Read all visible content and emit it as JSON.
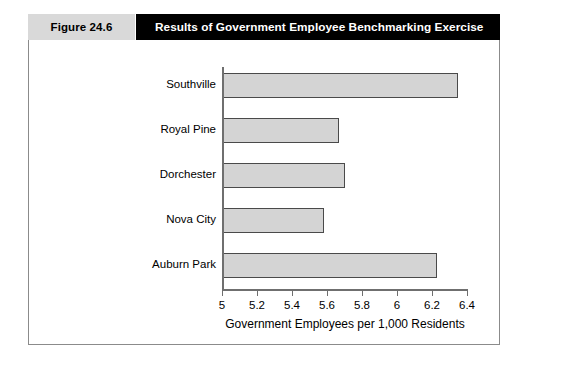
{
  "figure": {
    "number_label": "Figure 24.6",
    "title": "Results of Government Employee Benchmarking Exercise"
  },
  "colors": {
    "header_bar": "#000000",
    "number_cell": "#d9d9d9",
    "bar_fill": "#d4d4d4",
    "bar_stroke": "#4a4a4a",
    "axis": "#6f6f6f",
    "frame": "#8b8b8b"
  },
  "chart_data": {
    "type": "bar",
    "orientation": "horizontal",
    "title": "Results of Government Employee Benchmarking Exercise",
    "categories": [
      "Southville",
      "Royal Pine",
      "Dorchester",
      "Nova City",
      "Auburn Park"
    ],
    "values": [
      6.35,
      5.67,
      5.7,
      5.58,
      6.23
    ],
    "xlabel": "Government Employees per 1,000 Residents",
    "ylabel": "",
    "xlim": [
      5,
      6.4
    ],
    "xticks": [
      5,
      5.2,
      5.4,
      5.6,
      5.8,
      6,
      6.2,
      6.4
    ],
    "xtick_labels": [
      "5",
      "5.2",
      "5.4",
      "5.6",
      "5.8",
      "6",
      "6.2",
      "6.4"
    ],
    "grid": false,
    "legend": false
  }
}
